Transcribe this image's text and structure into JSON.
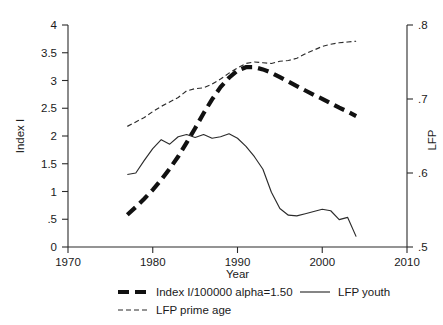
{
  "chart_data": {
    "type": "line",
    "title": "",
    "xlabel": "Year",
    "ylabel": "Index I",
    "y2label": "LFP",
    "xlim": [
      1970,
      2010
    ],
    "ylim": [
      0,
      4
    ],
    "y2lim": [
      0.5,
      0.8
    ],
    "grid": false,
    "legend_position": "bottom",
    "xticks": [
      "1970",
      "1980",
      "1990",
      "2000",
      "2010"
    ],
    "xtick_values": [
      1970,
      1980,
      1990,
      2000,
      2010
    ],
    "yticks": [
      "0",
      ".5",
      "1",
      "1.5",
      "2",
      "2.5",
      "3",
      "3.5",
      "4"
    ],
    "ytick_values": [
      0,
      0.5,
      1,
      1.5,
      2,
      2.5,
      3,
      3.5,
      4
    ],
    "y2ticks": [
      ".5",
      ".6",
      ".7",
      ".8"
    ],
    "y2tick_values": [
      0.5,
      0.6,
      0.7,
      0.8
    ],
    "series": [
      {
        "name": "Index I/100000 alpha=1.50",
        "axis": "left",
        "style": "thick-dashed",
        "x": [
          1977,
          1978,
          1979,
          1980,
          1981,
          1982,
          1983,
          1984,
          1985,
          1986,
          1987,
          1988,
          1989,
          1990,
          1991,
          1992,
          1993,
          1994,
          1995,
          1996,
          1997,
          1998,
          1999,
          2000,
          2001,
          2002,
          2003,
          2004
        ],
        "values": [
          0.58,
          0.72,
          0.87,
          1.03,
          1.21,
          1.41,
          1.63,
          1.88,
          2.14,
          2.41,
          2.66,
          2.88,
          3.05,
          3.18,
          3.24,
          3.24,
          3.2,
          3.14,
          3.06,
          2.98,
          2.9,
          2.82,
          2.74,
          2.67,
          2.59,
          2.51,
          2.44,
          2.36
        ]
      },
      {
        "name": "LFP youth",
        "axis": "right",
        "style": "thin-solid",
        "x": [
          1977,
          1978,
          1979,
          1980,
          1981,
          1982,
          1983,
          1984,
          1985,
          1986,
          1987,
          1988,
          1989,
          1990,
          1991,
          1992,
          1993,
          1994,
          1995,
          1996,
          1997,
          1998,
          1999,
          2000,
          2001,
          2002,
          2003,
          2004
        ],
        "values": [
          0.598,
          0.6,
          0.617,
          0.633,
          0.645,
          0.639,
          0.649,
          0.652,
          0.648,
          0.652,
          0.647,
          0.649,
          0.653,
          0.647,
          0.636,
          0.622,
          0.605,
          0.574,
          0.552,
          0.543,
          0.542,
          0.545,
          0.548,
          0.551,
          0.549,
          0.537,
          0.54,
          0.514
        ]
      },
      {
        "name": "LFP prime age",
        "axis": "right",
        "style": "thin-dashed",
        "x": [
          1977,
          1978,
          1979,
          1980,
          1981,
          1982,
          1983,
          1984,
          1985,
          1986,
          1987,
          1988,
          1989,
          1990,
          1991,
          1992,
          1993,
          1994,
          1995,
          1996,
          1997,
          1998,
          1999,
          2000,
          2001,
          2002,
          2003,
          2004
        ],
        "values": [
          0.663,
          0.669,
          0.675,
          0.683,
          0.69,
          0.696,
          0.702,
          0.711,
          0.714,
          0.715,
          0.72,
          0.727,
          0.735,
          0.742,
          0.748,
          0.75,
          0.749,
          0.748,
          0.751,
          0.752,
          0.755,
          0.761,
          0.766,
          0.771,
          0.774,
          0.776,
          0.777,
          0.778
        ]
      }
    ],
    "legend": [
      {
        "label": "Index I/100000 alpha=1.50",
        "style": "thick-dashed"
      },
      {
        "label": "LFP youth",
        "style": "thin-solid"
      },
      {
        "label": "LFP prime age",
        "style": "thin-dashed"
      }
    ]
  },
  "axes": {
    "left_title": "Index I",
    "right_title": "LFP",
    "x_title": "Year"
  }
}
